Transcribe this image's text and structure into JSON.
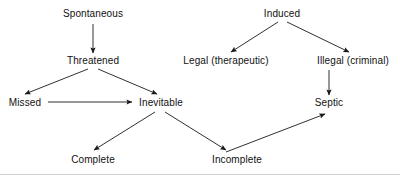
{
  "diagram": {
    "type": "flowchart",
    "background_color": "#ffffff",
    "line_color": "#1a1a1a",
    "text_color": "#111111",
    "width": 400,
    "height": 175,
    "nodes": [
      {
        "id": "spontaneous",
        "label": "Spontaneous",
        "x": 93,
        "y": 14
      },
      {
        "id": "induced",
        "label": "Induced",
        "x": 282,
        "y": 14
      },
      {
        "id": "threatened",
        "label": "Threatened",
        "x": 93,
        "y": 61
      },
      {
        "id": "legal",
        "label": "Legal (therapeutic)",
        "x": 226,
        "y": 61
      },
      {
        "id": "illegal",
        "label": "Illegal (criminal)",
        "x": 353,
        "y": 61
      },
      {
        "id": "missed",
        "label": "Missed",
        "x": 25,
        "y": 103
      },
      {
        "id": "inevitable",
        "label": "Inevitable",
        "x": 161,
        "y": 103
      },
      {
        "id": "septic",
        "label": "Septic",
        "x": 329,
        "y": 103
      },
      {
        "id": "complete",
        "label": "Complete",
        "x": 93,
        "y": 160
      },
      {
        "id": "incomplete",
        "label": "Incomplete",
        "x": 237,
        "y": 160
      }
    ],
    "edges": [
      {
        "id": "spontaneous-threatened",
        "from": "spontaneous",
        "to": "threatened",
        "x1": 93,
        "y1": 24,
        "x2": 93,
        "y2": 53
      },
      {
        "id": "induced-legal",
        "from": "induced",
        "to": "legal",
        "x1": 278,
        "y1": 22,
        "x2": 231,
        "y2": 52
      },
      {
        "id": "induced-illegal",
        "from": "induced",
        "to": "illegal",
        "x1": 287,
        "y1": 22,
        "x2": 349,
        "y2": 52
      },
      {
        "id": "threatened-missed",
        "from": "threatened",
        "to": "missed",
        "x1": 88,
        "y1": 69,
        "x2": 25,
        "y2": 94
      },
      {
        "id": "threatened-inevitable",
        "from": "threatened",
        "to": "inevitable",
        "x1": 98,
        "y1": 69,
        "x2": 157,
        "y2": 94
      },
      {
        "id": "missed-inevitable",
        "from": "missed",
        "to": "inevitable",
        "x1": 48,
        "y1": 102,
        "x2": 132,
        "y2": 102
      },
      {
        "id": "illegal-septic",
        "from": "illegal",
        "to": "septic",
        "x1": 329,
        "y1": 70,
        "x2": 329,
        "y2": 95
      },
      {
        "id": "inevitable-complete",
        "from": "inevitable",
        "to": "complete",
        "x1": 155,
        "y1": 112,
        "x2": 94,
        "y2": 150
      },
      {
        "id": "inevitable-incomplete",
        "from": "inevitable",
        "to": "incomplete",
        "x1": 165,
        "y1": 112,
        "x2": 226,
        "y2": 150
      },
      {
        "id": "incomplete-septic",
        "from": "incomplete",
        "to": "septic",
        "x1": 226,
        "y1": 152,
        "x2": 325,
        "y2": 114
      }
    ]
  }
}
